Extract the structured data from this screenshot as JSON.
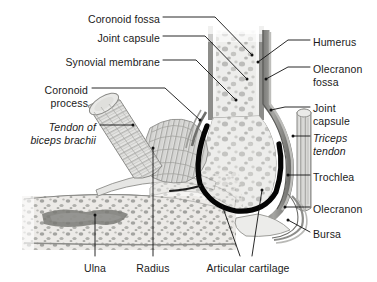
{
  "figure": {
    "background_color": "#ffffff",
    "text_color": "#1a1a1a",
    "leader_line_color": "#111111",
    "cartilage_color": "#000000",
    "bone_fill": "#efefef",
    "cortical_color": "#8a8a8a",
    "capsule_color": "#6e6e6e",
    "width": 377,
    "height": 282
  },
  "labels": {
    "left": [
      {
        "id": "coronoid-fossa",
        "text": "Coronoid fossa",
        "x": 160,
        "y": 13,
        "align": "r",
        "style": "normal"
      },
      {
        "id": "joint-capsule-left",
        "text": "Joint capsule",
        "x": 160,
        "y": 32,
        "align": "r",
        "style": "normal"
      },
      {
        "id": "synovial-membrane",
        "text": "Synovial membrane",
        "x": 160,
        "y": 56,
        "align": "r",
        "style": "normal"
      },
      {
        "id": "coronoid-process-1",
        "text": "Coronoid",
        "x": 88,
        "y": 84,
        "align": "r",
        "style": "normal"
      },
      {
        "id": "coronoid-process-2",
        "text": "process",
        "x": 88,
        "y": 97,
        "align": "r",
        "style": "normal"
      },
      {
        "id": "tendon-biceps-1",
        "text": "Tendon of",
        "x": 96,
        "y": 121,
        "align": "r",
        "style": "italic"
      },
      {
        "id": "tendon-biceps-2",
        "text": "biceps brachii",
        "x": 96,
        "y": 134,
        "align": "r",
        "style": "italic"
      }
    ],
    "right": [
      {
        "id": "humerus",
        "text": "Humerus",
        "x": 313,
        "y": 36,
        "align": "l",
        "style": "normal"
      },
      {
        "id": "olecranon-fossa-1",
        "text": "Olecranon",
        "x": 313,
        "y": 63,
        "align": "l",
        "style": "normal"
      },
      {
        "id": "olecranon-fossa-2",
        "text": "fossa",
        "x": 313,
        "y": 76,
        "align": "l",
        "style": "normal"
      },
      {
        "id": "joint-capsule-right-1",
        "text": "Joint",
        "x": 313,
        "y": 102,
        "align": "l",
        "style": "normal"
      },
      {
        "id": "joint-capsule-right-2",
        "text": "capsule",
        "x": 313,
        "y": 115,
        "align": "l",
        "style": "normal"
      },
      {
        "id": "triceps-tendon-1",
        "text": "Triceps",
        "x": 313,
        "y": 132,
        "align": "l",
        "style": "italic"
      },
      {
        "id": "triceps-tendon-2",
        "text": "tendon",
        "x": 313,
        "y": 145,
        "align": "l",
        "style": "italic"
      },
      {
        "id": "trochlea",
        "text": "Trochlea",
        "x": 313,
        "y": 171,
        "align": "l",
        "style": "normal"
      },
      {
        "id": "olecranon",
        "text": "Olecranon",
        "x": 313,
        "y": 203,
        "align": "l",
        "style": "normal"
      },
      {
        "id": "bursa",
        "text": "Bursa",
        "x": 313,
        "y": 228,
        "align": "l",
        "style": "normal"
      }
    ],
    "bottom": [
      {
        "id": "ulna",
        "text": "Ulna",
        "x": 95,
        "y": 266,
        "align": "c",
        "style": "normal"
      },
      {
        "id": "radius",
        "text": "Radius",
        "x": 153,
        "y": 266,
        "align": "c",
        "style": "normal"
      },
      {
        "id": "articular-cartilage",
        "text": "Articular cartilage",
        "x": 248,
        "y": 266,
        "align": "c",
        "style": "normal"
      }
    ]
  },
  "leader_lines": [
    {
      "id": "leader-coronoid-fossa",
      "points": "163,17 215,17 252,55"
    },
    {
      "id": "leader-joint-capsule-left",
      "points": "163,36 205,36 247,79"
    },
    {
      "id": "leader-synovial-membrane",
      "points": "163,60 196,60 236,100"
    },
    {
      "id": "leader-coronoid-process",
      "points": "92,88 165,88 200,120"
    },
    {
      "id": "leader-tendon-biceps",
      "points": "100,125 133,125"
    },
    {
      "id": "leader-humerus",
      "points": "310,40 288,40 258,62"
    },
    {
      "id": "leader-olecranon-fossa",
      "points": "310,67 288,67 266,79"
    },
    {
      "id": "leader-joint-capsule-right",
      "points": "310,107 285,107 271,110"
    },
    {
      "id": "leader-triceps-tendon",
      "points": "310,136 293,136"
    },
    {
      "id": "leader-trochlea",
      "points": "310,175 288,175"
    },
    {
      "id": "leader-olecranon",
      "points": "310,207 285,207"
    },
    {
      "id": "leader-bursa",
      "points": "310,232 288,220"
    },
    {
      "id": "leader-ulna",
      "points": "95,256 95,215"
    },
    {
      "id": "leader-radius",
      "points": "153,256 153,148"
    },
    {
      "id": "leader-articular-cartilage-a",
      "points": "240,256 222,205"
    },
    {
      "id": "leader-articular-cartilage-b",
      "points": "252,256 262,190"
    }
  ],
  "structures": [
    {
      "id": "humerus-shaft",
      "name": "Humerus shaft with trabecular bone"
    },
    {
      "id": "trochlea-body",
      "name": "Trochlea (distal humerus)"
    },
    {
      "id": "articular-cartilage-arc",
      "name": "Articular cartilage (thick dark arc)"
    },
    {
      "id": "ulna-body",
      "name": "Ulna"
    },
    {
      "id": "radius-body",
      "name": "Radius / coronoid region"
    },
    {
      "id": "biceps-tendon-body",
      "name": "Tendon of biceps brachii"
    },
    {
      "id": "coronoid-process-body",
      "name": "Coronoid process (striated fan)"
    },
    {
      "id": "triceps-tendon-body",
      "name": "Triceps tendon"
    },
    {
      "id": "bursa-body",
      "name": "Bursa"
    },
    {
      "id": "joint-capsule-body",
      "name": "Joint capsule"
    }
  ]
}
